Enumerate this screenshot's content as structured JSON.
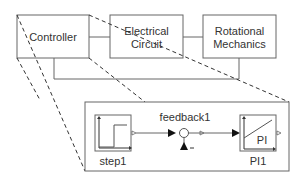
{
  "top_blocks": {
    "controller": "Controller",
    "electrical_line1": "Electrical",
    "electrical_line2": "Circuit",
    "rotational_line1": "Rotational",
    "rotational_line2": "Mechanics"
  },
  "detail": {
    "step_label": "step1",
    "feedback_label": "feedback1",
    "pi_label": "PI1",
    "pi_inner": "PI",
    "feedback_sign": "−"
  },
  "colors": {
    "stroke": "#666666",
    "text": "#333333",
    "fill": "#ffffff"
  }
}
